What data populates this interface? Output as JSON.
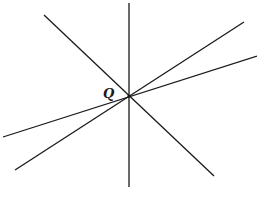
{
  "diagram": {
    "type": "concurrent-lines",
    "point_label": "Q",
    "intersection": {
      "x": 129,
      "y": 96
    },
    "line_color": "#1a1a1a",
    "background": "#ffffff",
    "lines": [
      {
        "name": "vertical-line",
        "x1": 129,
        "y1": 3,
        "x2": 129,
        "y2": 187
      },
      {
        "name": "descending-diagonal-line",
        "x1": 44,
        "y1": 15,
        "x2": 214,
        "y2": 176
      },
      {
        "name": "steep-ascending-line",
        "x1": 244,
        "y1": 22,
        "x2": 15,
        "y2": 170
      },
      {
        "name": "shallow-ascending-line",
        "x1": 257,
        "y1": 56,
        "x2": 3,
        "y2": 137
      }
    ],
    "label_position": {
      "x": 103,
      "y": 98
    }
  }
}
